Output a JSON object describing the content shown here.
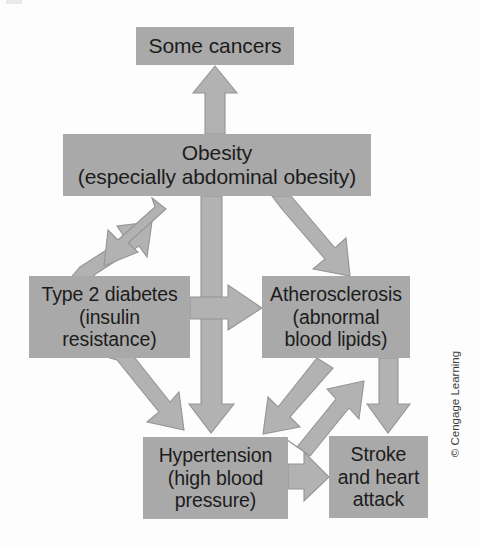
{
  "figure": {
    "copyright": "© Cengage Learning",
    "colors": {
      "box_fill": "#a9a9a9",
      "arrow_fill": "#b2b2b2",
      "arrow_stroke": "#8d8d8d",
      "text": "#1c1c1c",
      "background": "#fdfdfd"
    }
  },
  "nodes": {
    "cancers": {
      "label": "Some cancers",
      "lines": [
        "Some cancers"
      ]
    },
    "obesity": {
      "label": "Obesity (especially abdominal obesity)",
      "lines": [
        "Obesity",
        "(especially abdominal obesity)"
      ]
    },
    "diabetes": {
      "label": "Type 2 diabetes (insulin resistance)",
      "lines": [
        "Type 2 diabetes",
        "(insulin",
        "resistance)"
      ]
    },
    "atherosclerosis": {
      "label": "Atherosclerosis (abnormal blood lipids)",
      "lines": [
        "Atherosclerosis",
        "(abnormal",
        "blood lipids)"
      ]
    },
    "hypertension": {
      "label": "Hypertension (high blood pressure)",
      "lines": [
        "Hypertension",
        "(high blood",
        "pressure)"
      ]
    },
    "stroke": {
      "label": "Stroke and heart attack",
      "lines": [
        "Stroke",
        "and heart",
        "attack"
      ]
    }
  },
  "edges": [
    {
      "id": "obesity-to-cancers",
      "from": "obesity",
      "to": "cancers",
      "direction": "one-way",
      "orientation": "vertical-up"
    },
    {
      "id": "obesity-diabetes-down",
      "from": "obesity",
      "to": "diabetes",
      "direction": "one-way",
      "orientation": "diagonal-down-left"
    },
    {
      "id": "diabetes-obesity-up",
      "from": "diabetes",
      "to": "obesity",
      "direction": "one-way",
      "orientation": "diagonal-up-right"
    },
    {
      "id": "obesity-to-atherosclerosis",
      "from": "obesity",
      "to": "atherosclerosis",
      "direction": "one-way",
      "orientation": "diagonal-down-right"
    },
    {
      "id": "obesity-to-hypertension",
      "from": "obesity",
      "to": "hypertension",
      "direction": "one-way",
      "orientation": "vertical-down"
    },
    {
      "id": "diabetes-to-atherosclerosis",
      "from": "diabetes",
      "to": "atherosclerosis",
      "direction": "one-way",
      "orientation": "horizontal-right"
    },
    {
      "id": "diabetes-to-hypertension",
      "from": "diabetes",
      "to": "hypertension",
      "direction": "one-way",
      "orientation": "diagonal-down-right"
    },
    {
      "id": "atherosclerosis-to-hypertension",
      "from": "atherosclerosis",
      "to": "hypertension",
      "direction": "one-way",
      "orientation": "diagonal-down-left"
    },
    {
      "id": "hypertension-to-atherosclerosis",
      "from": "hypertension",
      "to": "atherosclerosis",
      "direction": "one-way",
      "orientation": "diagonal-up-right"
    },
    {
      "id": "atherosclerosis-to-stroke",
      "from": "atherosclerosis",
      "to": "stroke",
      "direction": "one-way",
      "orientation": "vertical-down"
    },
    {
      "id": "hypertension-to-stroke",
      "from": "hypertension",
      "to": "stroke",
      "direction": "one-way",
      "orientation": "horizontal-right"
    }
  ]
}
